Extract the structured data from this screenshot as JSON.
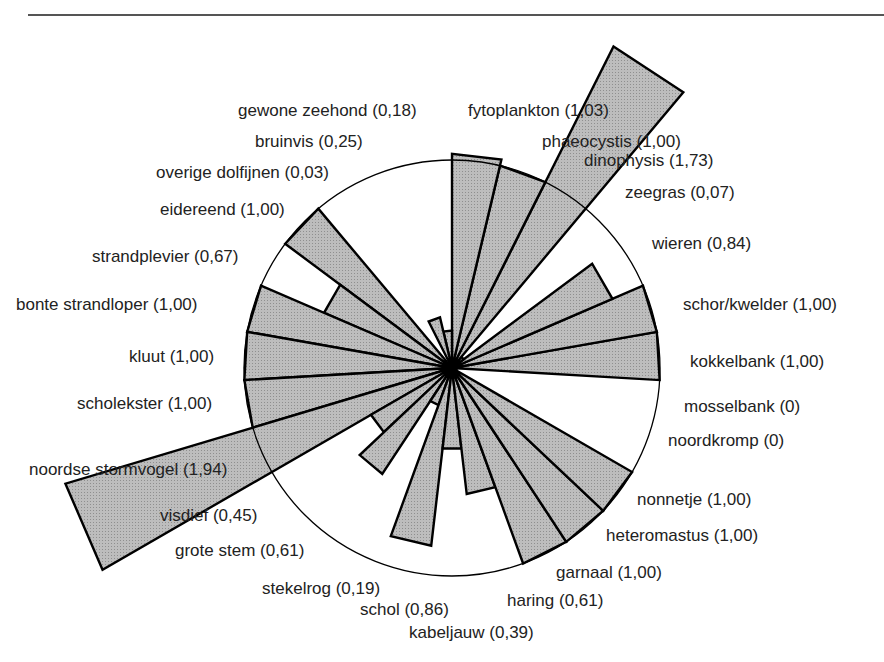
{
  "chart_data": {
    "type": "polar-bar",
    "title": "",
    "center": [
      452,
      368
    ],
    "unit_radius_px": 208,
    "start_angle_deg": -3.333,
    "sector_deg": 13.333,
    "direction": "counterclockwise",
    "reference_circle_value": 1.0,
    "bar_fill": "#b5b5b5",
    "bar_stroke": "#000000",
    "grid": false,
    "legend": null,
    "categories": [
      {
        "name": "kokkelbank",
        "value": 1.0,
        "label": "kokkelbank (1,00)"
      },
      {
        "name": "schor/kwelder",
        "value": 1.0,
        "label": "schor/kwelder (1,00)"
      },
      {
        "name": "wieren",
        "value": 0.84,
        "label": "wieren (0,84)"
      },
      {
        "name": "zeegras",
        "value": 0.07,
        "label": "zeegras (0,07)"
      },
      {
        "name": "dinophysis",
        "value": 1.73,
        "label": "dinophysis (1,73)"
      },
      {
        "name": "phaeocystis",
        "value": 1.0,
        "label": "phaeocystis (1,00)"
      },
      {
        "name": "fytoplankton",
        "value": 1.03,
        "label": "fytoplankton (1,03)"
      },
      {
        "name": "gewone zeehond",
        "value": 0.18,
        "label": "gewone zeehond (0,18)"
      },
      {
        "name": "bruinvis",
        "value": 0.25,
        "label": "bruinvis (0,25)"
      },
      {
        "name": "overige dolfijnen",
        "value": 0.03,
        "label": "overige dolfijnen (0,03)"
      },
      {
        "name": "eidereend",
        "value": 1.0,
        "label": "eidereend (1,00)"
      },
      {
        "name": "strandplevier",
        "value": 0.67,
        "label": "strandplevier (0,67)"
      },
      {
        "name": "bonte strandloper",
        "value": 1.0,
        "label": "bonte strandloper (1,00)"
      },
      {
        "name": "kluut",
        "value": 1.0,
        "label": "kluut (1,00)"
      },
      {
        "name": "scholekster",
        "value": 1.0,
        "label": "scholekster (1,00)"
      },
      {
        "name": "noordse stormvogel",
        "value": 1.94,
        "label": "noordse stormvogel (1,94)"
      },
      {
        "name": "visdief",
        "value": 0.45,
        "label": "visdief (0,45)"
      },
      {
        "name": "grote stem",
        "value": 0.61,
        "label": "grote stem (0,61)",
        "species_note": "label as rendered; likely 'grote stern'"
      },
      {
        "name": "stekelrog",
        "value": 0.19,
        "label": "stekelrog (0,19)"
      },
      {
        "name": "schol",
        "value": 0.86,
        "label": "schol (0,86)"
      },
      {
        "name": "kabeljauw",
        "value": 0.39,
        "label": "kabeljauw (0,39)"
      },
      {
        "name": "haring",
        "value": 0.61,
        "label": "haring (0,61)"
      },
      {
        "name": "garnaal",
        "value": 1.0,
        "label": "garnaal (1,00)"
      },
      {
        "name": "heteromastus",
        "value": 1.0,
        "label": "heteromastus (1,00)"
      },
      {
        "name": "nonnetje",
        "value": 1.0,
        "label": "nonnetje (1,00)"
      },
      {
        "name": "noordkromp",
        "value": 0,
        "label": "noordkromp (0)"
      },
      {
        "name": "mosselbank",
        "value": 0,
        "label": "mosselbank (0)"
      }
    ]
  },
  "labels": [
    {
      "text": "gewone zeehond (0,18)",
      "x": 238,
      "y": 116,
      "anchor": "start"
    },
    {
      "text": "fytoplankton (1,03)",
      "x": 468,
      "y": 116,
      "anchor": "start"
    },
    {
      "text": "bruinvis (0,25)",
      "x": 255,
      "y": 147,
      "anchor": "start"
    },
    {
      "text": "phaeocystis (1,00)",
      "x": 542,
      "y": 147,
      "anchor": "start"
    },
    {
      "text": "dinophysis (1,73)",
      "x": 584,
      "y": 166,
      "anchor": "start"
    },
    {
      "text": "overige dolfijnen (0,03)",
      "x": 156,
      "y": 178,
      "anchor": "start"
    },
    {
      "text": "zeegras (0,07)",
      "x": 625,
      "y": 198,
      "anchor": "start"
    },
    {
      "text": "eidereend (1,00)",
      "x": 160,
      "y": 215,
      "anchor": "start"
    },
    {
      "text": "wieren (0,84)",
      "x": 652,
      "y": 249,
      "anchor": "start"
    },
    {
      "text": "strandplevier (0,67)",
      "x": 92,
      "y": 262,
      "anchor": "start"
    },
    {
      "text": "bonte strandloper (1,00)",
      "x": 16,
      "y": 310,
      "anchor": "start"
    },
    {
      "text": "schor/kwelder (1,00)",
      "x": 683,
      "y": 310,
      "anchor": "start"
    },
    {
      "text": "kluut (1,00)",
      "x": 129,
      "y": 362,
      "anchor": "start"
    },
    {
      "text": "kokkelbank (1,00)",
      "x": 690,
      "y": 367,
      "anchor": "start"
    },
    {
      "text": "scholekster (1,00)",
      "x": 77,
      "y": 409,
      "anchor": "start"
    },
    {
      "text": "mosselbank (0)",
      "x": 684,
      "y": 412,
      "anchor": "start"
    },
    {
      "text": "noordkromp (0)",
      "x": 668,
      "y": 446,
      "anchor": "start"
    },
    {
      "text": "noordse stormvogel (1,94)",
      "x": 29,
      "y": 475,
      "anchor": "start"
    },
    {
      "text": "nonnetje (1,00)",
      "x": 637,
      "y": 505,
      "anchor": "start"
    },
    {
      "text": "visdief (0,45)",
      "x": 160,
      "y": 521,
      "anchor": "start"
    },
    {
      "text": "heteromastus (1,00)",
      "x": 606,
      "y": 541,
      "anchor": "start"
    },
    {
      "text": "grote stem (0,61)",
      "x": 175,
      "y": 556,
      "anchor": "start"
    },
    {
      "text": "garnaal (1,00)",
      "x": 556,
      "y": 578,
      "anchor": "start"
    },
    {
      "text": "stekelrog (0,19)",
      "x": 262,
      "y": 594,
      "anchor": "start"
    },
    {
      "text": "haring (0,61)",
      "x": 507,
      "y": 606,
      "anchor": "start"
    },
    {
      "text": "schol (0,86)",
      "x": 360,
      "y": 615,
      "anchor": "start"
    },
    {
      "text": "kabeljauw (0,39)",
      "x": 409,
      "y": 638,
      "anchor": "start"
    }
  ]
}
